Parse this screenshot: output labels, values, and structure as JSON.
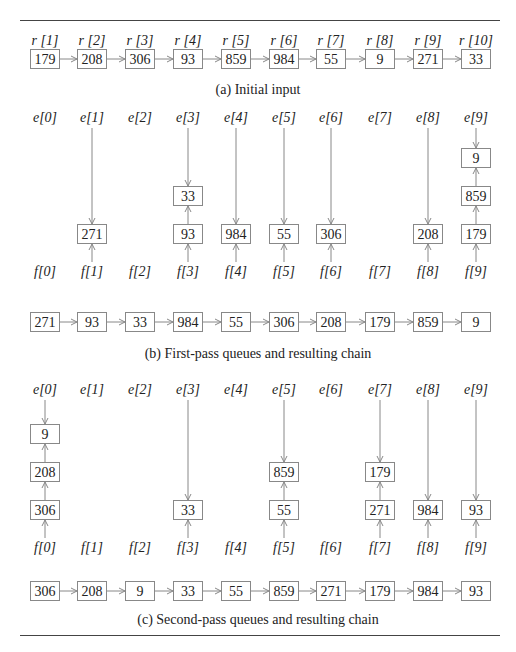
{
  "figure": {
    "panel_a": {
      "caption": "(a) Initial input",
      "labels": [
        "r [1]",
        "r [2]",
        "r [3]",
        "r [4]",
        "r [5]",
        "r [6]",
        "r [7]",
        "r [8]",
        "r [9]",
        "r [10]"
      ],
      "chain": [
        "179",
        "208",
        "306",
        "93",
        "859",
        "984",
        "55",
        "9",
        "271",
        "33"
      ]
    },
    "panel_b": {
      "caption": "(b) First-pass queues and resulting chain",
      "e_labels": [
        "e[0]",
        "e[1]",
        "e[2]",
        "e[3]",
        "e[4]",
        "e[5]",
        "e[6]",
        "e[7]",
        "e[8]",
        "e[9]"
      ],
      "f_labels": [
        "f[0]",
        "f[1]",
        "f[2]",
        "f[3]",
        "f[4]",
        "f[5]",
        "f[6]",
        "f[7]",
        "f[8]",
        "f[9]"
      ],
      "queues": [
        [],
        [
          "271"
        ],
        [],
        [
          "93",
          "33"
        ],
        [
          "984"
        ],
        [
          "55"
        ],
        [
          "306"
        ],
        [],
        [
          "208"
        ],
        [
          "179",
          "859",
          "9"
        ]
      ],
      "chain": [
        "271",
        "93",
        "33",
        "984",
        "55",
        "306",
        "208",
        "179",
        "859",
        "9"
      ]
    },
    "panel_c": {
      "caption": "(c) Second-pass queues and resulting chain",
      "e_labels": [
        "e[0]",
        "e[1]",
        "e[2]",
        "e[3]",
        "e[4]",
        "e[5]",
        "e[6]",
        "e[7]",
        "e[8]",
        "e[9]"
      ],
      "f_labels": [
        "f[0]",
        "f[1]",
        "f[2]",
        "f[3]",
        "f[4]",
        "f[5]",
        "f[6]",
        "f[7]",
        "f[8]",
        "f[9]"
      ],
      "queues": [
        [
          "306",
          "208",
          "9"
        ],
        [],
        [],
        [
          "33"
        ],
        [],
        [
          "55",
          "859"
        ],
        [],
        [
          "271",
          "179"
        ],
        [
          "984"
        ],
        [
          "93"
        ]
      ],
      "chain": [
        "306",
        "208",
        "9",
        "33",
        "55",
        "859",
        "271",
        "179",
        "984",
        "93"
      ]
    }
  }
}
